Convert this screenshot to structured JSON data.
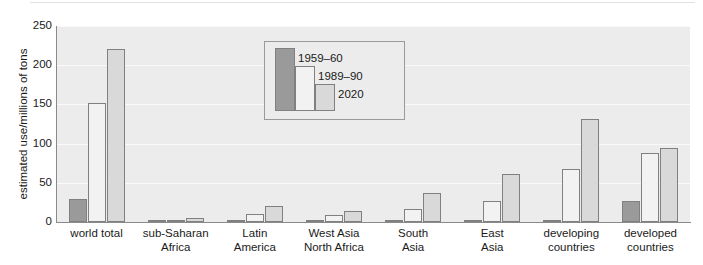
{
  "chart_data": {
    "type": "bar",
    "title": "",
    "xlabel": "",
    "ylabel": "estimated use/millions of tons",
    "ylim": [
      0,
      250
    ],
    "yticks": [
      250,
      200,
      150,
      100,
      50,
      0
    ],
    "grid": true,
    "legend_position": "inside-top-center",
    "categories": [
      "world total",
      "sub-Saharan\nAfrica",
      "Latin\nAmerica",
      "West Asia\nNorth Africa",
      "South\nAsia",
      "East\nAsia",
      "developing\ncountries",
      "developed\ncountries"
    ],
    "category_lines": [
      [
        "world total"
      ],
      [
        "sub-Saharan",
        "Africa"
      ],
      [
        "Latin",
        "America"
      ],
      [
        "West Asia",
        "North Africa"
      ],
      [
        "South",
        "Asia"
      ],
      [
        "East",
        "Asia"
      ],
      [
        "developing",
        "countries"
      ],
      [
        "developed",
        "countries"
      ]
    ],
    "series": [
      {
        "name": "1959–60",
        "color": "#9a9a9a",
        "values": [
          29,
          1,
          1,
          0.5,
          1,
          3,
          2,
          27
        ]
      },
      {
        "name": "1989–90",
        "color": "#f2f2f2",
        "values": [
          152,
          3,
          10,
          9,
          17,
          27,
          68,
          88
        ]
      },
      {
        "name": "2020",
        "color": "#d9d9d9",
        "values": [
          221,
          5,
          20,
          14,
          37,
          61,
          131,
          95
        ]
      }
    ]
  },
  "legend": {
    "entries": [
      "1959–60",
      "1989–90",
      "2020"
    ]
  }
}
